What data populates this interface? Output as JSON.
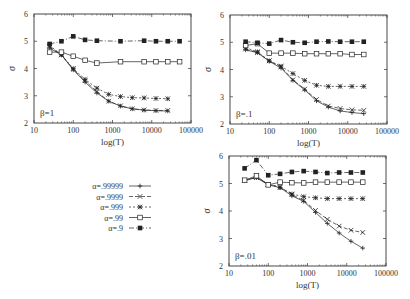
{
  "chart_data": [
    {
      "type": "line",
      "panel": "top-left",
      "annotation": "β=1",
      "xlabel": "log(T)",
      "ylabel": "σ",
      "xscale": "log",
      "xlim": [
        10,
        100000
      ],
      "ylim": [
        2,
        6
      ],
      "xticks": [
        "10",
        "100",
        "1000",
        "10000",
        "100000"
      ],
      "yticks": [
        "2",
        "3",
        "4",
        "5",
        "6"
      ],
      "frame": {
        "x0": 34,
        "y0": 14,
        "x1": 191,
        "y1": 123
      },
      "series": [
        {
          "name": "α=.99999",
          "marker": "plus",
          "dash": "",
          "x": [
            25,
            50,
            100,
            200,
            400,
            800,
            1600,
            3200,
            6400,
            12800,
            25600
          ],
          "values": [
            4.75,
            4.5,
            3.95,
            3.5,
            3.1,
            2.8,
            2.62,
            2.52,
            2.47,
            2.45,
            2.44
          ]
        },
        {
          "name": "α=.9999",
          "marker": "cross",
          "dash": "4,2",
          "x": [
            25,
            50,
            100,
            200,
            400,
            800,
            1600,
            3200,
            6400,
            12800,
            25600
          ],
          "values": [
            4.8,
            4.5,
            3.97,
            3.55,
            3.15,
            2.8,
            2.63,
            2.52,
            2.48,
            2.46,
            2.46
          ]
        },
        {
          "name": "α=.999",
          "marker": "star",
          "dash": "2,2",
          "x": [
            25,
            50,
            100,
            200,
            400,
            800,
            1600,
            3200,
            6400,
            12800,
            25600
          ],
          "values": [
            4.85,
            4.5,
            4.0,
            3.6,
            3.28,
            3.05,
            2.97,
            2.93,
            2.92,
            2.9,
            2.89
          ]
        },
        {
          "name": "α=.99",
          "marker": "open-square",
          "dash": "",
          "x": [
            25,
            50,
            100,
            200,
            400,
            1600,
            6400,
            12800,
            25600,
            51200
          ],
          "values": [
            4.6,
            4.6,
            4.45,
            4.3,
            4.2,
            4.25,
            4.25,
            4.25,
            4.25,
            4.25
          ]
        },
        {
          "name": "α=.9",
          "marker": "filled-square",
          "dash": "5,2,1,2",
          "x": [
            25,
            50,
            100,
            200,
            400,
            1600,
            6400,
            12800,
            25600,
            51200
          ],
          "values": [
            4.9,
            5.0,
            5.18,
            5.05,
            5.02,
            5.0,
            5.02,
            5.0,
            5.0,
            5.0
          ]
        }
      ]
    },
    {
      "type": "line",
      "panel": "top-right",
      "annotation": "β=.1",
      "xlabel": "log(T)",
      "ylabel": "σ",
      "xscale": "log",
      "xlim": [
        10,
        100000
      ],
      "ylim": [
        2,
        6
      ],
      "xticks": [
        "10",
        "100",
        "1000",
        "10000",
        "100000"
      ],
      "yticks": [
        "2",
        "3",
        "4",
        "5",
        "6"
      ],
      "frame": {
        "x0": 230,
        "y0": 15,
        "x1": 387,
        "y1": 124
      },
      "series": [
        {
          "name": "α=.99999",
          "marker": "plus",
          "dash": "",
          "x": [
            25,
            50,
            100,
            200,
            400,
            800,
            1600,
            3200,
            6400,
            12800,
            25600
          ],
          "values": [
            4.72,
            4.62,
            4.3,
            4.05,
            3.6,
            3.25,
            2.85,
            2.62,
            2.48,
            2.42,
            2.38
          ]
        },
        {
          "name": "α=.9999",
          "marker": "cross",
          "dash": "4,2",
          "x": [
            25,
            50,
            100,
            200,
            400,
            800,
            1600,
            3200,
            6400,
            12800,
            25600
          ],
          "values": [
            4.75,
            4.62,
            4.32,
            4.1,
            3.62,
            3.28,
            2.9,
            2.66,
            2.57,
            2.52,
            2.5
          ]
        },
        {
          "name": "α=.999",
          "marker": "star",
          "dash": "2,2",
          "x": [
            25,
            50,
            100,
            200,
            400,
            800,
            1600,
            3200,
            6400,
            12800,
            25600
          ],
          "values": [
            4.8,
            4.65,
            4.32,
            4.12,
            3.85,
            3.6,
            3.42,
            3.38,
            3.38,
            3.38,
            3.38
          ]
        },
        {
          "name": "α=.99",
          "marker": "open-square",
          "dash": "",
          "x": [
            25,
            50,
            100,
            200,
            400,
            800,
            1600,
            3200,
            6400,
            12800,
            25600
          ],
          "values": [
            4.88,
            4.95,
            4.6,
            4.6,
            4.6,
            4.58,
            4.58,
            4.58,
            4.58,
            4.55,
            4.55
          ]
        },
        {
          "name": "α=.9",
          "marker": "filled-square",
          "dash": "5,2,1,2",
          "x": [
            25,
            50,
            100,
            200,
            400,
            800,
            1600,
            3200,
            6400,
            12800,
            25600
          ],
          "values": [
            5.02,
            4.98,
            4.95,
            5.08,
            5.0,
            4.98,
            5.02,
            5.03,
            5.02,
            5.02,
            5.02
          ]
        }
      ]
    },
    {
      "type": "line",
      "panel": "bottom-right",
      "annotation": "β=.01",
      "xlabel": "log(T)",
      "ylabel": "σ",
      "xscale": "log",
      "xlim": [
        10,
        100000
      ],
      "ylim": [
        2,
        6
      ],
      "xticks": [
        "10",
        "100",
        "1000",
        "10000",
        "100000"
      ],
      "yticks": [
        "2",
        "3",
        "4",
        "5",
        "6"
      ],
      "frame": {
        "x0": 229,
        "y0": 156,
        "x1": 386,
        "y1": 266
      },
      "series": [
        {
          "name": "α=.99999",
          "marker": "plus",
          "dash": "",
          "x": [
            25,
            50,
            100,
            200,
            400,
            800,
            1600,
            3200,
            6400,
            12800,
            25600
          ],
          "values": [
            5.1,
            5.22,
            4.95,
            4.85,
            4.55,
            4.35,
            3.95,
            3.55,
            3.2,
            2.9,
            2.65
          ]
        },
        {
          "name": "α=.9999",
          "marker": "cross",
          "dash": "4,2",
          "x": [
            25,
            50,
            100,
            200,
            400,
            800,
            1600,
            3200,
            6400,
            12800,
            25600
          ],
          "values": [
            5.12,
            5.22,
            4.97,
            4.88,
            4.6,
            4.38,
            4.02,
            3.7,
            3.45,
            3.3,
            3.22
          ]
        },
        {
          "name": "α=.999",
          "marker": "star",
          "dash": "2,2",
          "x": [
            25,
            50,
            100,
            200,
            400,
            800,
            1600,
            3200,
            6400,
            12800,
            25600
          ],
          "values": [
            5.12,
            5.22,
            4.97,
            4.85,
            4.62,
            4.52,
            4.48,
            4.45,
            4.45,
            4.45,
            4.45
          ]
        },
        {
          "name": "α=.99",
          "marker": "open-square",
          "dash": "",
          "x": [
            25,
            50,
            100,
            200,
            400,
            800,
            1600,
            3200,
            6400,
            12800,
            25600
          ],
          "values": [
            5.12,
            5.28,
            4.95,
            5.05,
            5.03,
            5.02,
            5.05,
            5.05,
            5.05,
            5.05,
            5.05
          ]
        },
        {
          "name": "α=.9",
          "marker": "filled-square",
          "dash": "5,2,1,2",
          "x": [
            25,
            50,
            100,
            200,
            400,
            800,
            1600,
            3200,
            6400,
            12800,
            25600
          ],
          "values": [
            5.55,
            5.85,
            5.3,
            5.35,
            5.42,
            5.45,
            5.42,
            5.38,
            5.4,
            5.4,
            5.4
          ]
        }
      ]
    }
  ],
  "legend": {
    "position": {
      "x": 125,
      "y": 186
    },
    "entries": [
      {
        "label": "α=.99999",
        "marker": "plus",
        "dash": ""
      },
      {
        "label": "α=.9999",
        "marker": "cross",
        "dash": "4,2"
      },
      {
        "label": "α=.999",
        "marker": "star",
        "dash": "2,2"
      },
      {
        "label": "α=.99",
        "marker": "open-square",
        "dash": ""
      },
      {
        "label": "α=.9",
        "marker": "filled-square",
        "dash": "5,2,1,2"
      }
    ]
  },
  "colors": {
    "ink": "#222222",
    "frame": "#333333"
  }
}
